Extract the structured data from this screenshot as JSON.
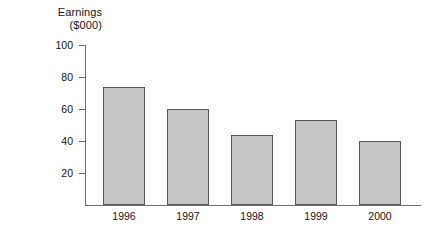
{
  "chart_data": {
    "type": "bar",
    "title": "",
    "ylabel_lines": [
      "Earnings",
      "($000)"
    ],
    "xlabel": "",
    "categories": [
      "1996",
      "1997",
      "1998",
      "1999",
      "2000"
    ],
    "values": [
      74,
      60,
      44,
      53,
      40
    ],
    "ylim": [
      0,
      100
    ],
    "yticks": [
      20,
      40,
      60,
      80,
      100
    ],
    "ytick_labels": [
      "20",
      "40",
      "60",
      "80",
      "100"
    ],
    "grid": false,
    "legend": "none",
    "bar_fill_color": "#c6c6c6",
    "bar_edge_color": "#585858",
    "axis_color": "#6e6e6e",
    "background_color": "#ffffff"
  },
  "axis_title": {
    "line1": "Earnings",
    "line2": "($000)"
  }
}
